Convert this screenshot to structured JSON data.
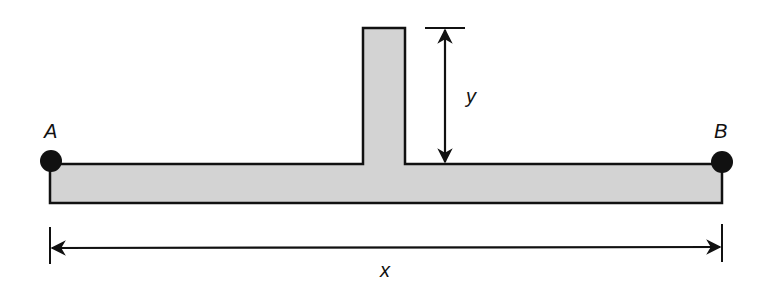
{
  "diagram": {
    "labels": {
      "point_a": "A",
      "point_b": "B",
      "height": "y",
      "span": "x"
    },
    "colors": {
      "fill": "#d3d3d3",
      "stroke": "#111111",
      "background": "#ffffff"
    }
  }
}
